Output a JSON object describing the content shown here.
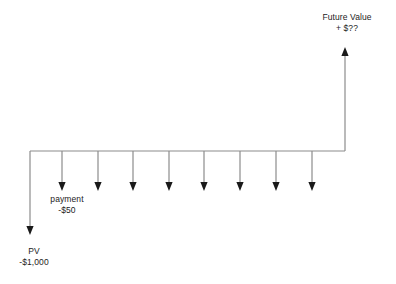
{
  "diagram": {
    "type": "cash-flow-timeline",
    "background_color": "#ffffff",
    "line_color": "#8c8c8c",
    "arrowhead_color": "#1a1a1a",
    "text_color": "#1c1c1c",
    "timeline": {
      "x_start": 30,
      "x_end": 345,
      "y": 151
    },
    "present_value": {
      "label": "PV",
      "amount": "-$1,000",
      "x": 30,
      "direction": "down",
      "arrow_tip_y": 234
    },
    "payment": {
      "label": "payment",
      "amount": "-$50",
      "count": 8,
      "direction": "down",
      "arrow_tip_y": 190,
      "x_positions": [
        62,
        98,
        133,
        169,
        204,
        240,
        276,
        312
      ]
    },
    "future_value": {
      "label": "Future Value",
      "amount": "+ $??",
      "x": 345,
      "direction": "up",
      "arrow_tip_y": 48
    }
  }
}
